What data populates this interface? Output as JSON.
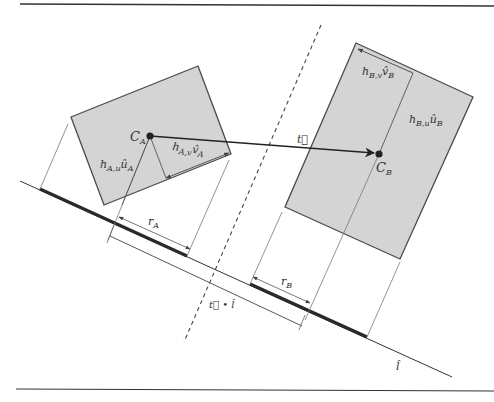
{
  "figure": {
    "type": "separating-axis-diagram",
    "colors": {
      "box_fill": "#d4d4d4",
      "box_stroke": "#4a4a4a",
      "line": "#333333",
      "thin_line": "#777777",
      "projection_bar": "#2a2a2a",
      "background": "#ffffff"
    },
    "labels": {
      "center_a": {
        "main": "C",
        "sub": "A"
      },
      "center_b": {
        "main": "C",
        "sub": "B"
      },
      "half_u_a": {
        "main": "h",
        "sub": "A,u",
        "vec": "û",
        "vec_sub": "A"
      },
      "half_v_a": {
        "main": "h",
        "sub": "A,v",
        "vec": "v̂",
        "vec_sub": "A"
      },
      "half_u_b": {
        "main": "h",
        "sub": "B,u",
        "vec": "û",
        "vec_sub": "B"
      },
      "half_v_b": {
        "main": "h",
        "sub": "B,v",
        "vec": "v̂",
        "vec_sub": "B"
      },
      "translation": "t⃗",
      "projection": "t⃗ • l̂",
      "radius_a": {
        "main": "r",
        "sub": "A"
      },
      "radius_b": {
        "main": "r",
        "sub": "B"
      },
      "axis": "l̂"
    }
  }
}
